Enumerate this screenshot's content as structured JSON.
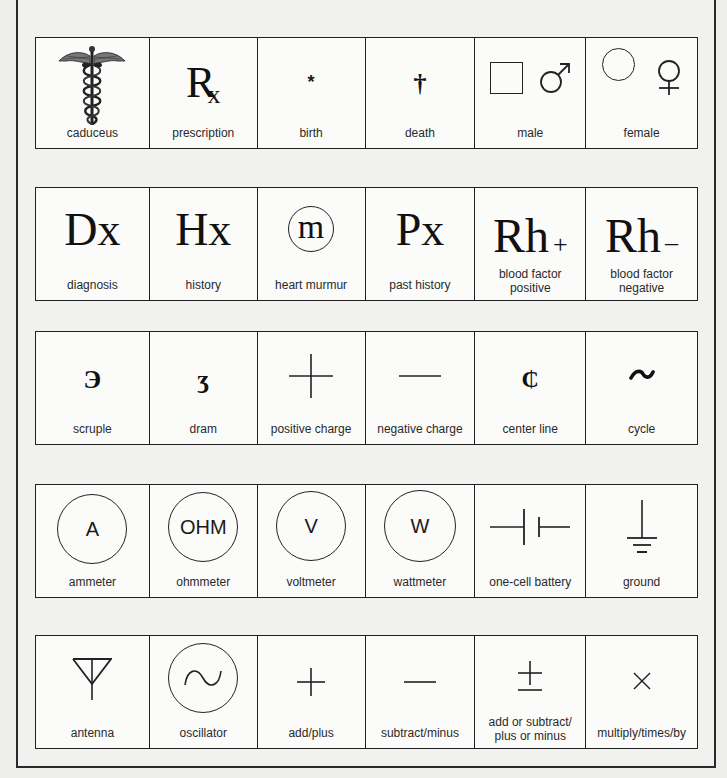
{
  "rows": [
    {
      "cells": [
        {
          "symbol": "",
          "icon": "caduceus-icon",
          "label": "caduceus"
        },
        {
          "symbol": "℞",
          "icon": "prescription-icon",
          "label": "prescription"
        },
        {
          "symbol": "*",
          "icon": "birth-asterisk-icon",
          "label": "birth"
        },
        {
          "symbol": "†",
          "icon": "death-dagger-icon",
          "label": "death"
        },
        {
          "symbol": "♂",
          "icon": "male-icon",
          "label": "male"
        },
        {
          "symbol": "♀",
          "icon": "female-icon",
          "label": "female"
        }
      ]
    },
    {
      "cells": [
        {
          "symbol": "Dx",
          "icon": "diagnosis-icon",
          "label": "diagnosis"
        },
        {
          "symbol": "Hx",
          "icon": "history-icon",
          "label": "history"
        },
        {
          "symbol": "m",
          "icon": "heart-murmur-icon",
          "label": "heart murmur"
        },
        {
          "symbol": "Px",
          "icon": "past-history-icon",
          "label": "past history"
        },
        {
          "symbol": "Rh",
          "suffix": "+",
          "icon": "rh-positive-icon",
          "label": "blood factor",
          "label2": "positive"
        },
        {
          "symbol": "Rh",
          "suffix": "–",
          "icon": "rh-negative-icon",
          "label": "blood factor",
          "label2": "negative"
        }
      ]
    },
    {
      "cells": [
        {
          "symbol": "℈",
          "icon": "scruple-icon",
          "label": "scruple"
        },
        {
          "symbol": "ʒ",
          "icon": "dram-icon",
          "label": "dram"
        },
        {
          "symbol": "+",
          "icon": "positive-charge-icon",
          "label": "positive charge"
        },
        {
          "symbol": "—",
          "icon": "negative-charge-icon",
          "label": "negative charge"
        },
        {
          "symbol": "℄",
          "icon": "center-line-icon",
          "label": "center line"
        },
        {
          "symbol": "~",
          "icon": "cycle-icon",
          "label": "cycle"
        }
      ]
    },
    {
      "cells": [
        {
          "symbol": "A",
          "icon": "ammeter-icon",
          "label": "ammeter"
        },
        {
          "symbol": "OHM",
          "icon": "ohmmeter-icon",
          "label": "ohmmeter"
        },
        {
          "symbol": "V",
          "icon": "voltmeter-icon",
          "label": "voltmeter"
        },
        {
          "symbol": "W",
          "icon": "wattmeter-icon",
          "label": "wattmeter"
        },
        {
          "symbol": "",
          "icon": "battery-icon",
          "label": "one-cell battery"
        },
        {
          "symbol": "",
          "icon": "ground-icon",
          "label": "ground"
        }
      ]
    },
    {
      "cells": [
        {
          "symbol": "",
          "icon": "antenna-icon",
          "label": "antenna"
        },
        {
          "symbol": "∿",
          "icon": "oscillator-icon",
          "label": "oscillator"
        },
        {
          "symbol": "+",
          "icon": "plus-icon",
          "label": "add/plus"
        },
        {
          "symbol": "—",
          "icon": "minus-icon",
          "label": "subtract/minus"
        },
        {
          "symbol": "±",
          "icon": "plus-minus-icon",
          "label": "add or subtract/",
          "label2": "plus or minus"
        },
        {
          "symbol": "×",
          "icon": "multiply-icon",
          "label": "multiply/times/by"
        }
      ]
    }
  ]
}
